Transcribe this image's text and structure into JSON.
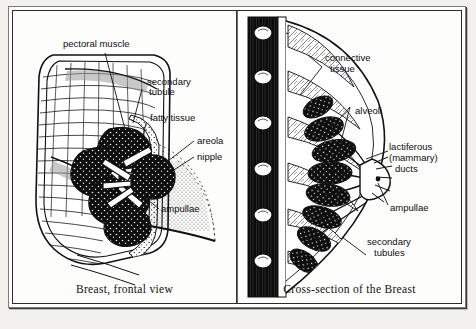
{
  "figure": {
    "background_color": "#f2f1ee",
    "ink_color": "#111111",
    "panels": [
      {
        "id": "frontal",
        "caption": "Breast, frontal view",
        "labels": [
          {
            "id": "pectoral-muscle",
            "text": "pectoral muscle"
          },
          {
            "id": "secondary-tubule",
            "text": "secondary\ntubule"
          },
          {
            "id": "fatty-tissue",
            "text": "fatty tissue"
          },
          {
            "id": "areola",
            "text": "areola"
          },
          {
            "id": "nipple",
            "text": "nipple"
          },
          {
            "id": "ampullae",
            "text": "ampullae"
          }
        ]
      },
      {
        "id": "cross-section",
        "caption": "Cross-section of the Breast",
        "labels": [
          {
            "id": "connective-tissue",
            "text": "connective\ntissue"
          },
          {
            "id": "alveoli",
            "text": "alveoli"
          },
          {
            "id": "lactiferous-ducts",
            "text": "lactiferous\n(mammary)\nducts"
          },
          {
            "id": "ampullae",
            "text": "ampullae"
          },
          {
            "id": "secondary-tubules",
            "text": "secondary\ntubules"
          }
        ]
      }
    ]
  },
  "labels_flat": {
    "pectoral_muscle": "pectoral muscle",
    "secondary_tubule_l1": "secondary",
    "secondary_tubule_l2": "tubule",
    "fatty_tissue": "fatty tissue",
    "areola": "areola",
    "nipple": "nipple",
    "ampullae_left": "ampullae",
    "connective_l1": "connective",
    "connective_l2": "tissue",
    "alveoli": "alveoli",
    "lactiferous_l1": "lactiferous",
    "lactiferous_l2": "(mammary)",
    "lactiferous_l3": "ducts",
    "ampullae_right": "ampullae",
    "secondary_tubules_l1": "secondary",
    "secondary_tubules_l2": "tubules"
  },
  "captions": {
    "left": "Breast, frontal view",
    "right": "Cross-section of the Breast"
  }
}
